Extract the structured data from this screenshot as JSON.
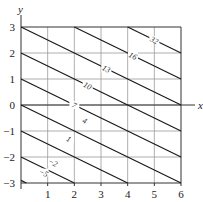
{
  "chart_data": {
    "type": "contour",
    "title": "",
    "xlabel": "x",
    "ylabel": "y",
    "xlim": [
      0,
      6
    ],
    "ylim": [
      -3,
      3
    ],
    "grid": true,
    "x_ticks": [
      "1",
      "2",
      "3",
      "4",
      "5",
      "6"
    ],
    "y_ticks": [
      "3",
      "2",
      "1",
      "0",
      "−1",
      "−2",
      "−3"
    ],
    "contour_slope": -0.5,
    "contours": [
      {
        "level_label": "32",
        "start": [
          4,
          3
        ],
        "end": [
          6,
          2
        ],
        "label_pos": [
          5.0,
          2.5
        ]
      },
      {
        "level_label": "16",
        "start": [
          2,
          3
        ],
        "end": [
          6,
          1
        ],
        "label_pos": [
          4.2,
          1.9
        ]
      },
      {
        "level_label": "13",
        "start": [
          0,
          3
        ],
        "end": [
          6,
          0
        ],
        "label_pos": [
          3.2,
          1.4
        ]
      },
      {
        "level_label": "10",
        "start": [
          0,
          2
        ],
        "end": [
          6,
          -1
        ],
        "label_pos": [
          2.5,
          0.75
        ]
      },
      {
        "level_label": "7",
        "start": [
          0,
          1
        ],
        "end": [
          6,
          -2
        ],
        "label_pos": [
          2.0,
          0.0
        ]
      },
      {
        "level_label": "4",
        "start": [
          0,
          0
        ],
        "end": [
          6,
          -3
        ],
        "label_pos": [
          2.4,
          -0.6
        ]
      },
      {
        "level_label": "1",
        "start": [
          0,
          -1
        ],
        "end": [
          4,
          -3
        ],
        "label_pos": [
          1.8,
          -1.3
        ]
      },
      {
        "level_label": "−2",
        "start": [
          0,
          -2
        ],
        "end": [
          2,
          -3
        ],
        "label_pos": [
          1.2,
          -2.2
        ]
      },
      {
        "level_label": "−5",
        "start": [
          0,
          -2.9
        ],
        "end": [
          0.2,
          -3
        ],
        "label_pos": [
          0.85,
          -2.6
        ]
      }
    ]
  }
}
